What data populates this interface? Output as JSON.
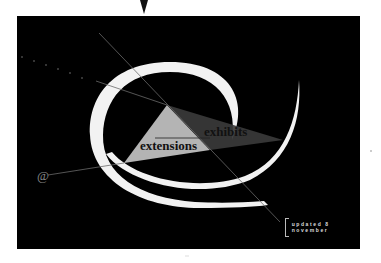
{
  "graphic": {
    "labels": {
      "extensions": "extensions",
      "exhibits": "exhibits",
      "at_symbol": "@"
    },
    "updated": "updated 8 november"
  },
  "colors": {
    "background": "#000000",
    "ring": "#f2f2f2",
    "light_triangle": "#b4b4b4",
    "dark_triangle": "#3a3a3a",
    "lines": "#6a6a6a"
  }
}
